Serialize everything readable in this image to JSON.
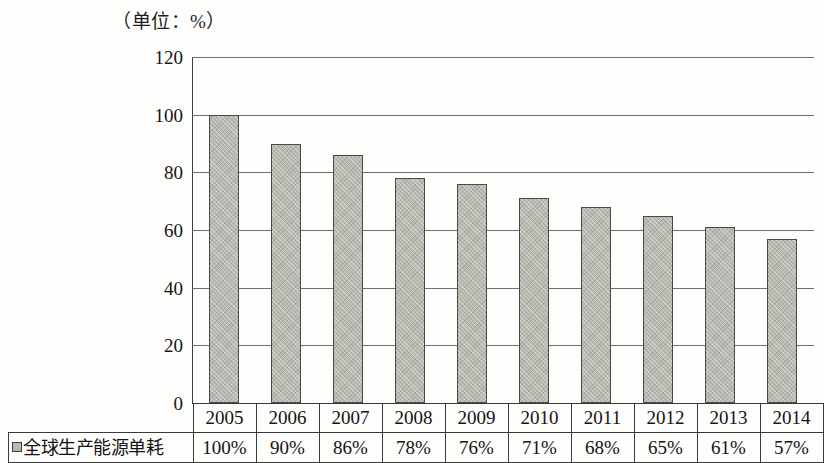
{
  "caption": {
    "unit_label": "（单位：%）"
  },
  "chart_data": {
    "type": "bar",
    "title": "",
    "subtitle": "",
    "xlabel": "",
    "ylabel": "",
    "unit": "%",
    "unit_note": "（单位：%）",
    "categories": [
      "2005",
      "2006",
      "2007",
      "2008",
      "2009",
      "2010",
      "2011",
      "2012",
      "2013",
      "2014"
    ],
    "series": [
      {
        "name": "全球生产能源单耗",
        "values": [
          100,
          90,
          86,
          78,
          76,
          71,
          68,
          65,
          61,
          57
        ],
        "value_labels": [
          "100%",
          "90%",
          "86%",
          "78%",
          "76%",
          "71%",
          "68%",
          "65%",
          "61%",
          "57%"
        ],
        "color": "#b9b9b1",
        "border_color": "#4a4a48"
      }
    ],
    "ylim": [
      0,
      120
    ],
    "yticks": [
      0,
      20,
      40,
      60,
      80,
      100,
      120
    ],
    "ytick_labels": [
      "0",
      "20",
      "40",
      "60",
      "80",
      "100",
      "120"
    ],
    "grid": true,
    "grid_axis": "y",
    "legend": {
      "position": "bottom-left-table",
      "entries": [
        {
          "label": "全球生产能源单耗",
          "marker": "square-swatch",
          "color": "#b9b9b1"
        }
      ]
    }
  },
  "table": {
    "legend_row_label": "全球生产能源单耗",
    "header_row": [
      "2005",
      "2006",
      "2007",
      "2008",
      "2009",
      "2010",
      "2011",
      "2012",
      "2013",
      "2014"
    ],
    "value_row": [
      "100%",
      "90%",
      "86%",
      "78%",
      "76%",
      "71%",
      "68%",
      "65%",
      "61%",
      "57%"
    ]
  }
}
